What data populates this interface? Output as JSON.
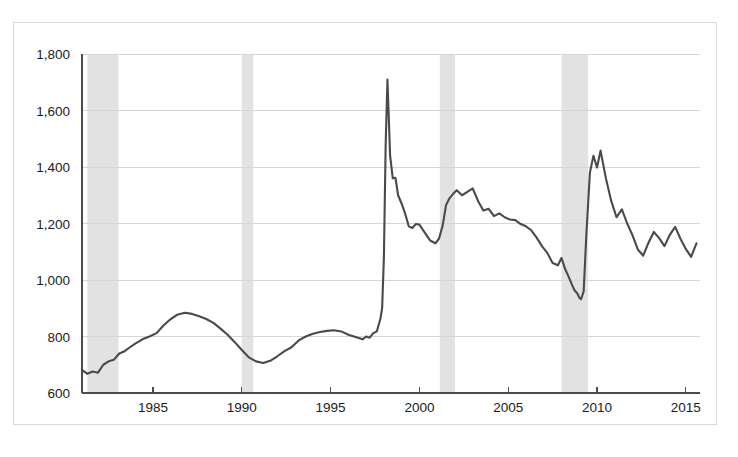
{
  "chart_data": {
    "type": "line",
    "title": "",
    "subtitle": "",
    "xlabel": "",
    "ylabel": "",
    "xlim": [
      1981.0,
      2015.8
    ],
    "ylim": [
      600,
      1800
    ],
    "grid": true,
    "legend_position": "none",
    "y_ticks": [
      600,
      800,
      1000,
      1200,
      1400,
      1600,
      1800
    ],
    "y_tick_labels": [
      "600",
      "800",
      "1,000",
      "1,200",
      "1,400",
      "1,600",
      "1,800"
    ],
    "x_ticks": [
      1985,
      1990,
      1995,
      2000,
      2005,
      2010,
      2015
    ],
    "x_tick_labels": [
      "1985",
      "1990",
      "1995",
      "2000",
      "2005",
      "2010",
      "2015"
    ],
    "series": [
      {
        "name": "series-1",
        "color": "#4a4a4a",
        "x": [
          1981.0,
          1981.3,
          1981.6,
          1981.9,
          1982.2,
          1982.5,
          1982.8,
          1983.1,
          1983.4,
          1983.7,
          1984.0,
          1984.4,
          1984.8,
          1985.2,
          1985.6,
          1986.0,
          1986.4,
          1986.8,
          1987.2,
          1987.6,
          1988.0,
          1988.4,
          1988.8,
          1989.2,
          1989.6,
          1990.0,
          1990.4,
          1990.8,
          1991.2,
          1991.6,
          1992.0,
          1992.4,
          1992.8,
          1993.2,
          1993.6,
          1994.0,
          1994.4,
          1994.8,
          1995.2,
          1995.6,
          1996.0,
          1996.4,
          1996.8,
          1997.0,
          1997.2,
          1997.4,
          1997.6,
          1997.8,
          1997.9,
          1998.0,
          1998.1,
          1998.2,
          1998.35,
          1998.5,
          1998.65,
          1998.8,
          1999.0,
          1999.2,
          1999.4,
          1999.6,
          1999.8,
          2000.0,
          2000.3,
          2000.6,
          2000.9,
          2001.1,
          2001.3,
          2001.5,
          2001.7,
          2001.9,
          2002.1,
          2002.4,
          2002.7,
          2003.0,
          2003.3,
          2003.6,
          2003.9,
          2004.2,
          2004.5,
          2004.8,
          2005.1,
          2005.4,
          2005.7,
          2006.0,
          2006.3,
          2006.6,
          2006.9,
          2007.2,
          2007.5,
          2007.8,
          2008.0,
          2008.2,
          2008.4,
          2008.6,
          2008.75,
          2008.9,
          2009.0,
          2009.1,
          2009.25,
          2009.4,
          2009.6,
          2009.8,
          2010.0,
          2010.2,
          2010.5,
          2010.8,
          2011.1,
          2011.4,
          2011.7,
          2012.0,
          2012.3,
          2012.6,
          2012.9,
          2013.2,
          2013.5,
          2013.8,
          2014.1,
          2014.4,
          2014.7,
          2015.0,
          2015.3,
          2015.6
        ],
        "y": [
          682,
          668,
          676,
          672,
          700,
          712,
          718,
          740,
          748,
          762,
          775,
          790,
          800,
          812,
          840,
          862,
          878,
          884,
          880,
          872,
          862,
          848,
          828,
          806,
          780,
          752,
          726,
          712,
          706,
          714,
          730,
          748,
          762,
          786,
          800,
          810,
          816,
          820,
          822,
          818,
          806,
          798,
          790,
          800,
          796,
          812,
          818,
          862,
          900,
          1080,
          1480,
          1710,
          1440,
          1360,
          1362,
          1300,
          1270,
          1234,
          1190,
          1184,
          1198,
          1196,
          1168,
          1140,
          1130,
          1146,
          1190,
          1265,
          1290,
          1305,
          1318,
          1300,
          1312,
          1324,
          1280,
          1246,
          1252,
          1226,
          1236,
          1222,
          1214,
          1212,
          1198,
          1190,
          1176,
          1150,
          1120,
          1096,
          1060,
          1052,
          1078,
          1040,
          1012,
          982,
          962,
          952,
          938,
          932,
          960,
          1160,
          1380,
          1440,
          1398,
          1458,
          1360,
          1280,
          1222,
          1250,
          1200,
          1158,
          1108,
          1086,
          1132,
          1170,
          1148,
          1120,
          1160,
          1188,
          1146,
          1110,
          1082,
          1130
        ]
      }
    ],
    "shaded_regions": [
      {
        "name": "recession-band-1",
        "x0": 1981.3,
        "x1": 1983.05,
        "color": "#e2e2e2"
      },
      {
        "name": "recession-band-2",
        "x0": 1990.0,
        "x1": 1990.65,
        "color": "#e2e2e2"
      },
      {
        "name": "recession-band-3",
        "x0": 2001.15,
        "x1": 2002.0,
        "color": "#e2e2e2"
      },
      {
        "name": "recession-band-4",
        "x0": 2008.0,
        "x1": 2009.5,
        "color": "#e2e2e2"
      }
    ],
    "colors": {
      "series": "#4a4a4a",
      "grid": "#d6d6d6",
      "axis": "#4c4c4c",
      "shaded": "#e2e2e2",
      "frame": "#d8d8d8",
      "background": "#ffffff",
      "tick_label": "#1b1b1b"
    }
  }
}
